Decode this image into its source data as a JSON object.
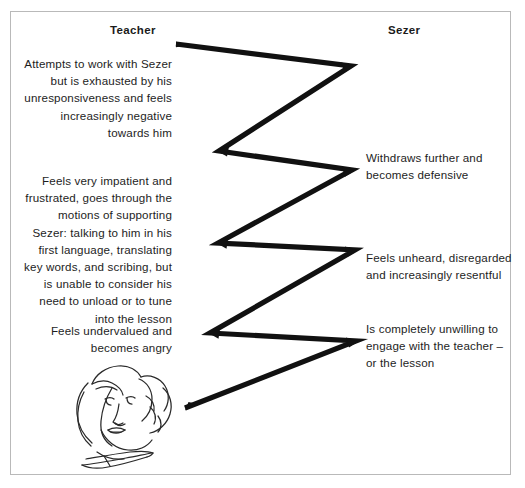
{
  "diagram": {
    "type": "interaction-cycle",
    "title_visible": false,
    "columns": [
      {
        "id": "teacher",
        "label": "Teacher"
      },
      {
        "id": "sezer",
        "label": "Sezer"
      }
    ],
    "teacher_notes": [
      {
        "id": "t1",
        "text": "Attempts to work with Sezer but is exhausted by his unresponsiveness and feels increasingly negative towards him"
      },
      {
        "id": "t2",
        "text": "Feels very impatient and frustrated, goes through the motions of supporting Sezer: talking to him in his first language, translating key words, and scribing, but is unable to consider his need to unload or to tune into the lesson"
      },
      {
        "id": "t3",
        "text": "Feels undervalued and becomes angry"
      }
    ],
    "sezer_notes": [
      {
        "id": "s1",
        "text": "Withdraws further and becomes defensive"
      },
      {
        "id": "s2",
        "text": "Feels unheard, disregarded and increasingly resentful"
      },
      {
        "id": "s3",
        "text": "Is completely unwilling to engage with the teacher – or the lesson"
      }
    ],
    "zigzag": {
      "description": "thick black zigzag line linking teacher column to sezer column",
      "stroke_color": "#111111",
      "points": [
        [
          176,
          44
        ],
        [
          351,
          66
        ],
        [
          219,
          151
        ],
        [
          352,
          170
        ],
        [
          218,
          243
        ],
        [
          355,
          250
        ],
        [
          210,
          333
        ],
        [
          356,
          341
        ],
        [
          185,
          408
        ]
      ]
    },
    "illustration": {
      "name": "face-sketch",
      "description": "line drawing of a face with hair, lower left",
      "stroke_color": "#2a2a2a"
    },
    "colors": {
      "frame_border": "#b9b9b9",
      "text": "#1d1d1d",
      "heading": "#1b1b1b",
      "line": "#111111",
      "background": "#ffffff"
    }
  }
}
